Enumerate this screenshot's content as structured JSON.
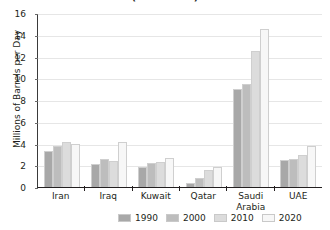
{
  "chart_data": {
    "type": "bar",
    "title": "(estimated)",
    "xlabel": "",
    "ylabel": "Millions of Barrels per Day",
    "ylim": [
      0,
      16
    ],
    "yticks": [
      0,
      2,
      4,
      6,
      8,
      10,
      12,
      14,
      16
    ],
    "ytick_labels": [
      "0",
      "2",
      "4",
      "6",
      "8",
      "10",
      "12",
      "14",
      "16"
    ],
    "grid": true,
    "legend_position": "bottom",
    "categories": [
      "Iran",
      "Iraq",
      "Kuwait",
      "Qatar",
      "Saudi Arabia",
      "UAE"
    ],
    "series": [
      {
        "name": "1990",
        "color": "#a8a8a8",
        "values": [
          3.3,
          2.1,
          1.8,
          0.4,
          9.0,
          2.5
        ]
      },
      {
        "name": "2000",
        "color": "#bdbdbd",
        "values": [
          3.8,
          2.6,
          2.2,
          0.8,
          9.5,
          2.6
        ]
      },
      {
        "name": "2010",
        "color": "#dcdcdc",
        "values": [
          4.1,
          2.4,
          2.3,
          1.6,
          12.5,
          2.9
        ]
      },
      {
        "name": "2020",
        "color": "#f7f7f7",
        "values": [
          4.0,
          4.1,
          2.7,
          1.8,
          14.5,
          3.8
        ]
      }
    ]
  },
  "colors": {
    "axis": "#231f20",
    "grid": "#e6e6e6",
    "text": "#231f20",
    "background": "#ffffff"
  }
}
